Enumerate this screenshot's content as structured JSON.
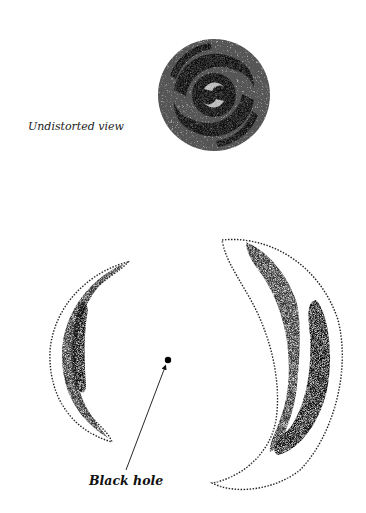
{
  "labels": {
    "undistorted": "Undistorted view",
    "black_hole": "Black hole"
  },
  "figure": {
    "elements": [
      {
        "name": "undistorted-spiral-galaxy",
        "center": [
          214,
          95
        ],
        "radius": 58
      },
      {
        "name": "left-lensed-arc",
        "position": "left of black hole"
      },
      {
        "name": "right-lensed-arc",
        "position": "right of black hole"
      },
      {
        "name": "black-hole-dot",
        "center": [
          168,
          360
        ]
      }
    ],
    "colors": {
      "ink": "#111111",
      "background": "#ffffff"
    }
  }
}
